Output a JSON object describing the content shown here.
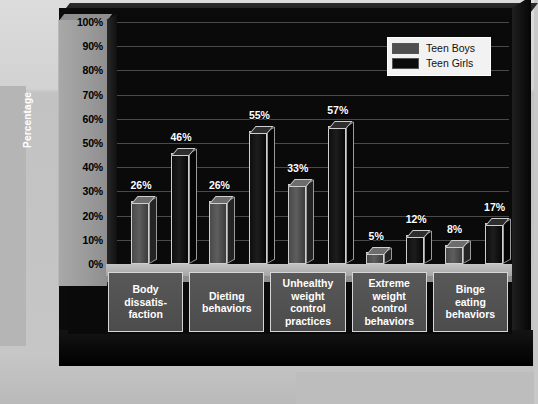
{
  "chart_data": {
    "type": "bar",
    "title": "",
    "xlabel": "",
    "ylabel": "Percentage",
    "ylim": [
      0,
      100
    ],
    "ytick_labels": [
      "100%",
      "90%",
      "80%",
      "70%",
      "60%",
      "50%",
      "40%",
      "30%",
      "20%",
      "10%",
      "0%"
    ],
    "ytick_values": [
      100,
      90,
      80,
      70,
      60,
      50,
      40,
      30,
      20,
      10,
      0
    ],
    "grid": true,
    "legend_position": "top-right",
    "categories": [
      "Body\ndissatis-\nfaction",
      "Dieting\nbehaviors",
      "Unhealthy\nweight\ncontrol\npractices",
      "Extreme\nweight\ncontrol\nbehaviors",
      "Binge\neating\nbehaviors"
    ],
    "series": [
      {
        "name": "Teen Boys",
        "color": "#4f4f4f",
        "values": [
          26,
          26,
          33,
          5,
          8
        ],
        "value_labels": [
          "26%",
          "26%",
          "33%",
          "5%",
          "8%"
        ]
      },
      {
        "name": "Teen Girls",
        "color": "#101010",
        "values": [
          46,
          55,
          57,
          12,
          17
        ],
        "value_labels": [
          "46%",
          "55%",
          "57%",
          "12%",
          "17%"
        ]
      }
    ]
  },
  "legend": {
    "entries": [
      {
        "label": "Teen Boys",
        "swatch": "#4f4f4f"
      },
      {
        "label": "Teen Girls",
        "swatch": "#0c0c0c"
      }
    ]
  },
  "axis": {
    "y_title": "Percentage"
  }
}
